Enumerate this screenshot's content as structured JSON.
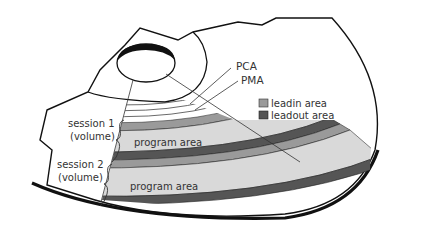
{
  "diagram": {
    "labels": {
      "pca": "PCA",
      "pma": "PMA",
      "session1_line1": "session 1",
      "session1_line2": "(volume)",
      "session2_line1": "session 2",
      "session2_line2": "(volume)",
      "program_area_1": "program area",
      "program_area_2": "program area"
    },
    "legend": {
      "items": [
        {
          "label": "leadin area",
          "color": "#9a9a9a"
        },
        {
          "label": "leadout area",
          "color": "#555555"
        }
      ]
    },
    "colors": {
      "outline": "#111111",
      "program_area": "#d9d9d9",
      "leadin": "#9a9a9a",
      "leadout": "#555555",
      "background": "#ffffff"
    }
  }
}
